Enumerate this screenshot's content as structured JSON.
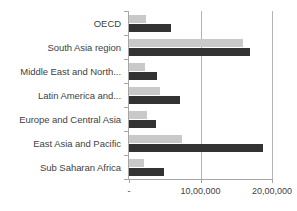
{
  "chart_data": {
    "type": "bar",
    "orientation": "horizontal",
    "title": "",
    "subtitle": "",
    "xlabel": "",
    "ylabel": "",
    "grid": true,
    "legend": "none",
    "xlim": [
      0,
      2000000
    ],
    "categories": [
      "OECD",
      "South Asia region",
      "Middle East and North...",
      "Latin America and...",
      "Europe and Central Asia",
      "East Asia and Pacific",
      "Sub Saharan Africa"
    ],
    "tick_labels": [
      "-",
      "10,00,000",
      "20,00,000"
    ],
    "tick_values": [
      0,
      1000000,
      2000000
    ],
    "series": [
      {
        "name": "series-1",
        "color": "#c9c9c9",
        "values": [
          240000,
          1595000,
          225000,
          430000,
          250000,
          740000,
          210000
        ]
      },
      {
        "name": "series-2",
        "color": "#333333",
        "values": [
          590000,
          1690000,
          390000,
          710000,
          375000,
          1870000,
          490000
        ]
      }
    ]
  },
  "colors": {
    "series_light": "#c9c9c9",
    "series_dark": "#333333",
    "axis": "#a6a6a6",
    "gridline": "#b4b4b4",
    "text": "#3f3f3f",
    "background": "#ffffff"
  }
}
